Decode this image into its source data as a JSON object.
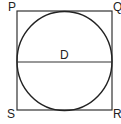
{
  "diagram": {
    "vertices": {
      "top_left": "P",
      "top_right": "Q",
      "bottom_right": "R",
      "bottom_left": "S"
    },
    "diameter_label": "D",
    "colors": {
      "stroke": "#222222",
      "background": "#ffffff"
    }
  }
}
